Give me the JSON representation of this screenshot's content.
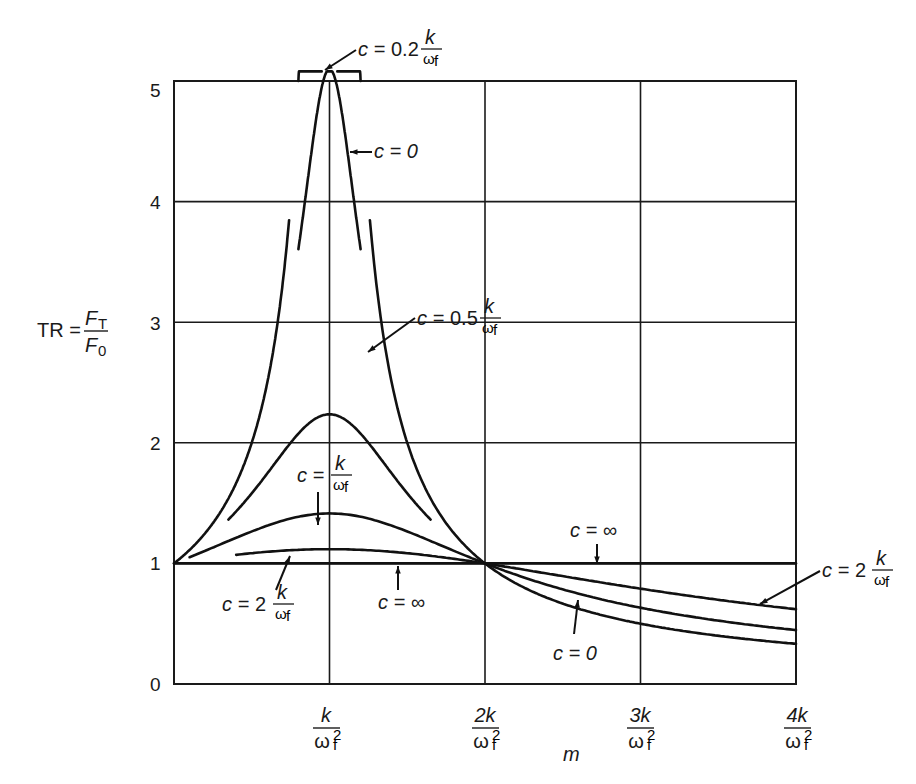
{
  "chart_data": {
    "type": "line",
    "title": "",
    "xlabel": "m",
    "ylabel": "TR = F_T / F_0",
    "xlim": [
      0,
      4
    ],
    "ylim": [
      0,
      5
    ],
    "grid": true,
    "x_ticks": [
      {
        "value": 1,
        "label_num": "k",
        "label_den": "ω",
        "label_sub": "f",
        "label_sup": "2"
      },
      {
        "value": 2,
        "label_num": "2k",
        "label_den": "ω",
        "label_sub": "f",
        "label_sup": "2"
      },
      {
        "value": 3,
        "label_num": "3k",
        "label_den": "ω",
        "label_sub": "f",
        "label_sup": "2"
      },
      {
        "value": 4,
        "label_num": "4k",
        "label_den": "ω",
        "label_sub": "f",
        "label_sup": "2"
      }
    ],
    "y_ticks": [
      0,
      1,
      2,
      3,
      4,
      5
    ],
    "x_unit_note": "x values expressed in units of k/ω_f²; damping c in units of k/ω_f",
    "series": [
      {
        "name": "c = 0",
        "c": 0,
        "segments": [
          [
            0,
            0.74
          ],
          [
            1.26,
            4
          ]
        ],
        "sample": {
          "x": [
            0,
            0.5,
            0.74,
            1.26,
            1.5,
            2,
            3,
            4
          ],
          "y": [
            1,
            2,
            3.85,
            3.85,
            2,
            1,
            0.5,
            0.33
          ]
        }
      },
      {
        "name": "c = 0.2 k/ω_f",
        "c": 0.2,
        "range": [
          0.8,
          1.2
        ],
        "sample": {
          "x": [
            0.8,
            0.9,
            1.0,
            1.1,
            1.2
          ],
          "y": [
            3.6,
            4.6,
            5.1,
            4.6,
            3.6
          ]
        }
      },
      {
        "name": "c = 0.5 k/ω_f",
        "c": 0.5,
        "range": [
          0.35,
          1.65
        ],
        "sample": {
          "x": [
            0.35,
            0.6,
            1.0,
            1.4,
            1.65
          ],
          "y": [
            1.35,
            1.75,
            2.24,
            1.75,
            1.35
          ]
        }
      },
      {
        "name": "c = k/ω_f",
        "c": 1,
        "range": [
          0.1,
          4
        ],
        "sample": {
          "x": [
            0.1,
            0.5,
            1.0,
            1.5,
            2.0
          ],
          "y": [
            1.05,
            1.26,
            1.41,
            1.26,
            1.0
          ]
        }
      },
      {
        "name": "c = 2 k/ω_f",
        "c": 2,
        "range": [
          0.4,
          4
        ],
        "sample": {
          "x": [
            0.4,
            1.0,
            2.0,
            3.0,
            4.0
          ],
          "y": [
            1.07,
            1.12,
            1.0,
            0.79,
            0.62
          ]
        }
      },
      {
        "name": "c = ∞",
        "c": "infinity",
        "range": [
          0,
          4
        ],
        "sample": {
          "x": [
            0,
            2,
            4
          ],
          "y": [
            1,
            1,
            1
          ]
        }
      }
    ],
    "annotations": [
      {
        "text": "c = 0.2 k/ω_f",
        "points_to": "peak of c=0.2 curve"
      },
      {
        "text": "c = 0",
        "points_to": "upper c=0 branch"
      },
      {
        "text": "c = 0.5 k/ω_f",
        "points_to": "c=0.5 curve"
      },
      {
        "text": "c = k/ω_f",
        "points_to": "c=1 curve"
      },
      {
        "text": "c = 2 k/ω_f",
        "points_to": "c=2 curve (left)"
      },
      {
        "text": "c = ∞",
        "points_to": "TR=1 line (left)"
      },
      {
        "text": "c = ∞",
        "points_to": "TR=1 line (right)"
      },
      {
        "text": "c = 2 k/ω_f",
        "points_to": "c=2 curve (right)"
      },
      {
        "text": "c = 0",
        "points_to": "lower c=0 curve (right)"
      }
    ]
  },
  "labels": {
    "ylabel_prefix": "TR =",
    "ylabel_num": "F",
    "ylabel_num_sub": "T",
    "ylabel_den": "F",
    "ylabel_den_sub": "0",
    "xlabel": "m",
    "y_ticks": [
      "0",
      "1",
      "2",
      "3",
      "4",
      "5"
    ],
    "x_ticks": [
      {
        "num": "k",
        "den": "ω",
        "sub": "f",
        "sup": "2"
      },
      {
        "num": "2k",
        "den": "ω",
        "sub": "f",
        "sup": "2"
      },
      {
        "num": "3k",
        "den": "ω",
        "sub": "f",
        "sup": "2"
      },
      {
        "num": "4k",
        "den": "ω",
        "sub": "f",
        "sup": "2"
      }
    ],
    "ann": {
      "c_eq": "c =",
      "c02": "0.2",
      "c05": "0.5",
      "c2": "2",
      "c0": "c = 0",
      "cinf": "c = ∞",
      "k": "k",
      "omega": "ω",
      "f": "f"
    }
  }
}
